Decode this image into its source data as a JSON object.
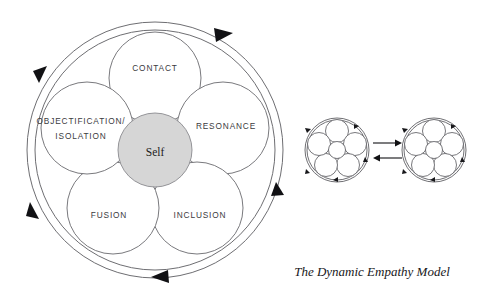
{
  "figure": {
    "caption": "The Dynamic Empathy Model",
    "background_color": "#ffffff",
    "line_color": "#6a6a6e",
    "arrow_color": "#111114",
    "self_fill_color": "#d6d6d6",
    "label_color": "#3b3b40"
  },
  "main_diagram": {
    "name": "dynamic-empathy-model-wheel",
    "center_node": {
      "label": "Self",
      "fill": "#d6d6d6"
    },
    "petals": [
      {
        "id": "contact",
        "label": "CONTACT",
        "angle_deg": 90,
        "position": "top"
      },
      {
        "id": "resonance",
        "label": "RESONANCE",
        "angle_deg": 18,
        "position": "right"
      },
      {
        "id": "inclusion",
        "label": "INCLUSION",
        "angle_deg": -54,
        "position": "bottom-right"
      },
      {
        "id": "fusion",
        "label": "FUSION",
        "angle_deg": -126,
        "position": "bottom-left"
      },
      {
        "id": "objectification-isolation",
        "label": "OBJECTIFICATION/",
        "label_line2": "ISOLATION",
        "angle_deg": 162,
        "position": "left"
      }
    ],
    "outer_ring": {
      "direction": "counterclockwise",
      "arrow_count": 4,
      "arrow_positions_deg": [
        62,
        152,
        218,
        298
      ]
    }
  },
  "exchange_diagram": {
    "name": "dyadic-exchange",
    "left_wheel": {
      "id": "wheel-left",
      "petal_count": 5,
      "has_center": true,
      "arrow_count": 4
    },
    "right_wheel": {
      "id": "wheel-right",
      "petal_count": 5,
      "has_center": true,
      "arrow_count": 4
    },
    "connectors": [
      {
        "id": "arrow-to-right",
        "direction": "right"
      },
      {
        "id": "arrow-to-left",
        "direction": "left"
      }
    ]
  }
}
